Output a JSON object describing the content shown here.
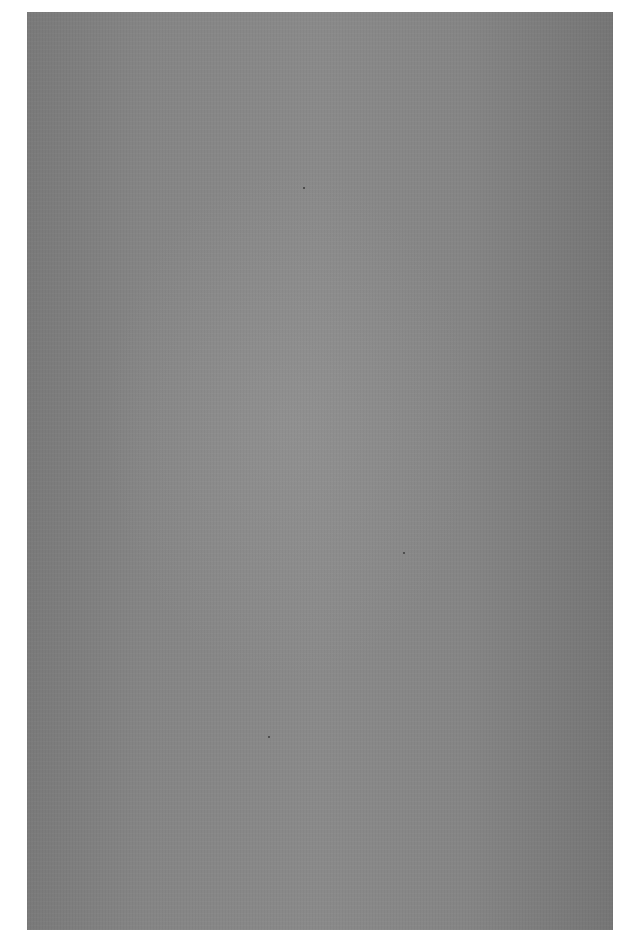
{
  "document": {
    "type": "scanned-page",
    "content": "",
    "colors": {
      "background": "#ffffff",
      "paper": "#818181",
      "paper_light": "#8c8c8c",
      "paper_dark": "#767676"
    }
  }
}
